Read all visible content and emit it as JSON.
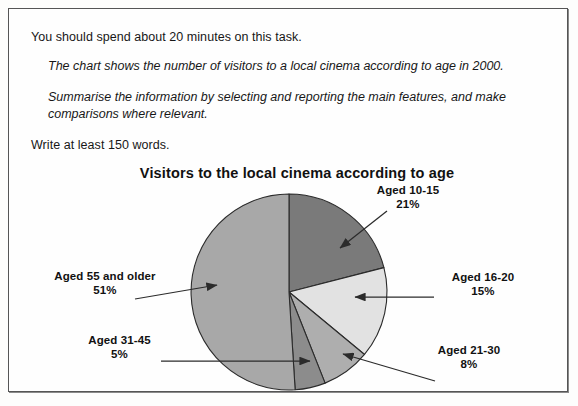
{
  "task": {
    "instruction": "You should spend about 20 minutes on this task.",
    "prompt_line_1": "The chart shows the number of visitors to a local cinema according to age in 2000.",
    "prompt_line_2": "Summarise the information by selecting and reporting the main features, and make",
    "prompt_line_3": "comparisons where relevant.",
    "word_count_note": "Write at least 150 words."
  },
  "chart_data": {
    "type": "pie",
    "title": "Visitors to the local cinema according to age",
    "xlabel": "",
    "ylabel": "",
    "legend_position": "callout-labels",
    "grid": false,
    "unit": "%",
    "categories": [
      "Aged 10-15",
      "Aged 16-20",
      "Aged 21-30",
      "Aged 31-45",
      "Aged 55 and older"
    ],
    "values": [
      21,
      15,
      8,
      5,
      51
    ],
    "slices": [
      {
        "label": "Aged 10-15",
        "value": 21,
        "value_text": "21%",
        "color": "#7a7a7a",
        "start_deg": 0,
        "end_deg": 75.6
      },
      {
        "label": "Aged 16-20",
        "value": 15,
        "value_text": "15%",
        "color": "#e2e2e2",
        "start_deg": 75.6,
        "end_deg": 129.6
      },
      {
        "label": "Aged 21-30",
        "value": 8,
        "value_text": "8%",
        "color": "#aeaeae",
        "start_deg": 129.6,
        "end_deg": 158.4
      },
      {
        "label": "Aged 31-45",
        "value": 5,
        "value_text": "5%",
        "color": "#8c8c8c",
        "start_deg": 158.4,
        "end_deg": 176.4
      },
      {
        "label": "Aged 55 and older",
        "value": 51,
        "value_text": "51%",
        "color": "#a8a8a8",
        "start_deg": 176.4,
        "end_deg": 360
      }
    ]
  },
  "colors": {
    "page_background": "#fefefe",
    "frame_border": "#555555",
    "text": "#171717",
    "slice_outline": "#2b2b2b",
    "leader_line": "#2b2b2b"
  }
}
